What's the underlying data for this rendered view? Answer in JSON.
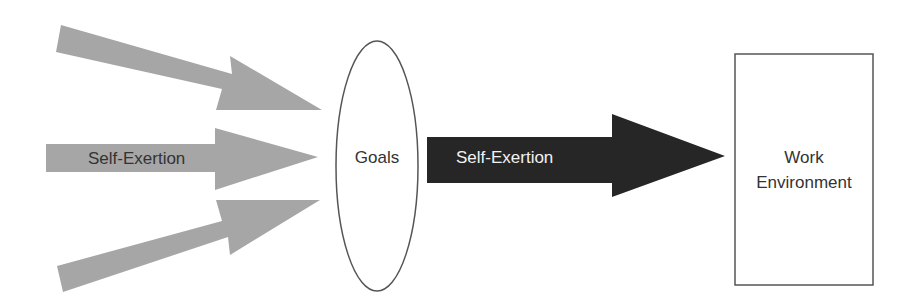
{
  "diagram": {
    "input_arrows": [
      {
        "id": "top",
        "label": ""
      },
      {
        "id": "middle",
        "label": "Self-Exertion"
      },
      {
        "id": "bottom",
        "label": ""
      }
    ],
    "goals": {
      "label": "Goals"
    },
    "output_arrow": {
      "label": "Self-Exertion"
    },
    "work_environment": {
      "line1": "Work",
      "line2": "Environment"
    },
    "colors": {
      "input_arrow_fill": "#a6a6a6",
      "output_arrow_fill": "#262626",
      "stroke": "#555555",
      "dark_text": "#333333",
      "light_text": "#f2f2f2"
    }
  }
}
